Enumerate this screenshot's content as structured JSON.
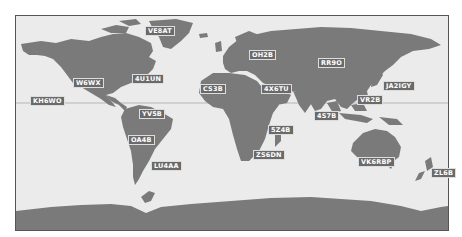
{
  "map": {
    "type": "world-map-equirectangular",
    "colors": {
      "land": "#7a7a7a",
      "ocean": "#ebebeb",
      "frame": "#555555",
      "label_bg": "#6a6a6a",
      "label_text": "#ffffff",
      "equator": "#b0b0b0"
    },
    "stations": [
      {
        "call": "VE8AT",
        "x": 145,
        "y": 26
      },
      {
        "call": "OH2B",
        "x": 249,
        "y": 50
      },
      {
        "call": "RR9O",
        "x": 318,
        "y": 58
      },
      {
        "call": "W6WX",
        "x": 73,
        "y": 78
      },
      {
        "call": "4U1UN",
        "x": 132,
        "y": 74
      },
      {
        "call": "CS3B",
        "x": 200,
        "y": 84
      },
      {
        "call": "4X6TU",
        "x": 261,
        "y": 84
      },
      {
        "call": "JA2IGY",
        "x": 383,
        "y": 81
      },
      {
        "call": "KH6WO",
        "x": 30,
        "y": 96
      },
      {
        "call": "VR2B",
        "x": 357,
        "y": 95
      },
      {
        "call": "YV5B",
        "x": 139,
        "y": 109
      },
      {
        "call": "4S7B",
        "x": 314,
        "y": 111
      },
      {
        "call": "5Z4B",
        "x": 268,
        "y": 125
      },
      {
        "call": "OA4B",
        "x": 128,
        "y": 135
      },
      {
        "call": "ZS6DN",
        "x": 253,
        "y": 150
      },
      {
        "call": "LU4AA",
        "x": 151,
        "y": 161
      },
      {
        "call": "VK6RBP",
        "x": 358,
        "y": 157
      },
      {
        "call": "ZL6B",
        "x": 431,
        "y": 168
      }
    ]
  }
}
